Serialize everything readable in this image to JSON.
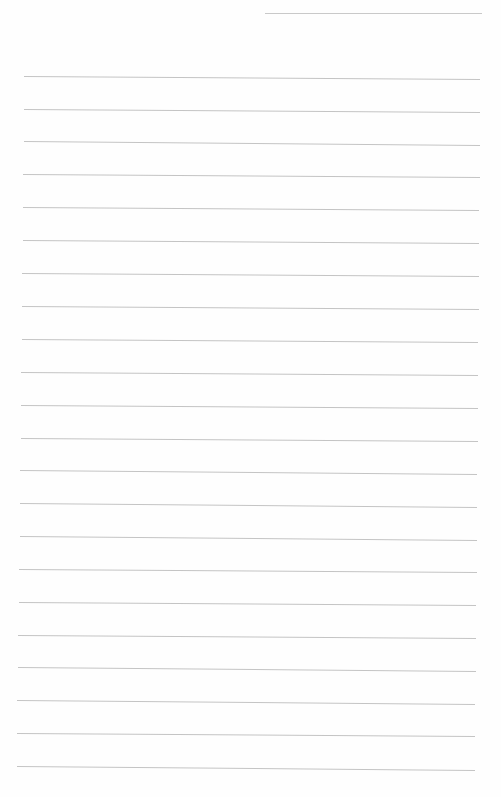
{
  "page": {
    "type": "lined-paper",
    "background": "#fefefe",
    "line_color": "#c4c4c4",
    "header_line": {
      "x1": 265,
      "x2": 482,
      "y": 13
    },
    "rule_count": 22,
    "rules": [
      {
        "y1": 76,
        "y2": 79,
        "x1": 24,
        "x2": 480
      },
      {
        "y1": 109,
        "y2": 112,
        "x1": 24,
        "x2": 480
      },
      {
        "y1": 141,
        "y2": 145,
        "x1": 24,
        "x2": 480
      },
      {
        "y1": 174,
        "y2": 177,
        "x1": 23,
        "x2": 480
      },
      {
        "y1": 207,
        "y2": 210,
        "x1": 23,
        "x2": 479
      },
      {
        "y1": 240,
        "y2": 243,
        "x1": 23,
        "x2": 479
      },
      {
        "y1": 273,
        "y2": 276,
        "x1": 22,
        "x2": 479
      },
      {
        "y1": 306,
        "y2": 309,
        "x1": 22,
        "x2": 479
      },
      {
        "y1": 339,
        "y2": 342,
        "x1": 22,
        "x2": 478
      },
      {
        "y1": 372,
        "y2": 375,
        "x1": 21,
        "x2": 478
      },
      {
        "y1": 405,
        "y2": 408,
        "x1": 21,
        "x2": 478
      },
      {
        "y1": 438,
        "y2": 441,
        "x1": 21,
        "x2": 478
      },
      {
        "y1": 470,
        "y2": 474,
        "x1": 20,
        "x2": 477
      },
      {
        "y1": 503,
        "y2": 507,
        "x1": 20,
        "x2": 477
      },
      {
        "y1": 536,
        "y2": 540,
        "x1": 20,
        "x2": 477
      },
      {
        "y1": 569,
        "y2": 572,
        "x1": 19,
        "x2": 477
      },
      {
        "y1": 602,
        "y2": 605,
        "x1": 19,
        "x2": 476
      },
      {
        "y1": 635,
        "y2": 638,
        "x1": 18,
        "x2": 476
      },
      {
        "y1": 667,
        "y2": 671,
        "x1": 18,
        "x2": 476
      },
      {
        "y1": 700,
        "y2": 704,
        "x1": 17,
        "x2": 475
      },
      {
        "y1": 733,
        "y2": 736,
        "x1": 17,
        "x2": 475
      },
      {
        "y1": 766,
        "y2": 770,
        "x1": 17,
        "x2": 475
      }
    ]
  }
}
